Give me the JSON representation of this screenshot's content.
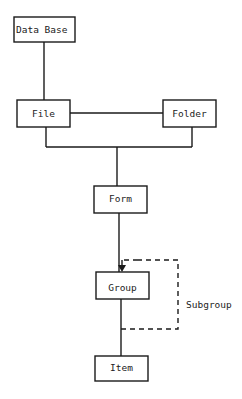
{
  "diagram": {
    "nodes": {
      "database": "Data Base",
      "file": "File",
      "folder": "Folder",
      "form": "Form",
      "group": "Group",
      "item": "Item"
    },
    "edges": [
      {
        "from": "Data Base",
        "to": "File",
        "style": "solid"
      },
      {
        "from": "File",
        "to": "Folder",
        "style": "solid"
      },
      {
        "from": "File",
        "to": "Form",
        "style": "solid"
      },
      {
        "from": "Folder",
        "to": "Form",
        "style": "solid"
      },
      {
        "from": "Form",
        "to": "Group",
        "style": "solid"
      },
      {
        "from": "Group",
        "to": "Item",
        "style": "solid"
      },
      {
        "from": "Group",
        "to": "Group",
        "style": "dashed",
        "label": "Subgroup"
      }
    ],
    "loop_label": "Subgroup"
  }
}
